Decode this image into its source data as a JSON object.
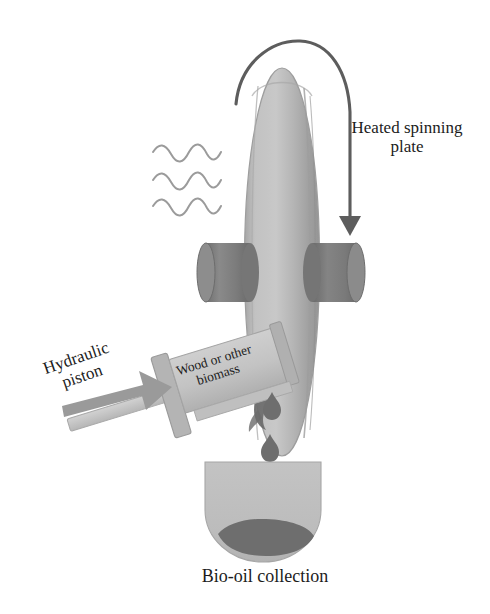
{
  "figure": {
    "background_color": "#ffffff",
    "width": 490,
    "height": 614
  },
  "labels": {
    "heated_plate": "Heated spinning\nplate",
    "hydraulic_piston": "Hydraulic\npiston",
    "biomass": "Wood or other\nbiomass",
    "bio_oil_collection": "Bio-oil collection"
  },
  "colors": {
    "plate_light_grey": "#b9b9b9",
    "plate_edge_grey": "#a2a2a2",
    "roller_dark_grey": "#7d7d7d",
    "syringe_body_grey": "#c2c2c2",
    "syringe_flange_grey": "#aeaeae",
    "piston_rod_grey": "#c8c8c8",
    "force_arrow_grey": "#9a9a9a",
    "oil_dark_grey": "#6e6e6e",
    "char_streak_grey": "#6b6b6b",
    "beaker_fill_grey": "#bdbdbd",
    "heat_wave_grey": "#9b9b9b",
    "rotation_arrow_grey": "#5d5d5d",
    "text_color": "#1c1c1c"
  },
  "components": [
    {
      "name": "heated-spinning-plate",
      "shape": "vertical elongated ellipse (disc seen edge-on)",
      "fill": "#b9b9b9",
      "bbox": [
        245,
        68,
        75,
        388
      ]
    },
    {
      "name": "rotation-arrow",
      "shape": "arc over plate top ending in downward arrowhead",
      "stroke": "#5d5d5d",
      "direction": "clockwise, from left over top down the right side"
    },
    {
      "name": "heat-waves",
      "shape": "three horizontal wavy lines",
      "count": 3,
      "stroke": "#9b9b9b",
      "bbox": [
        152,
        140,
        88,
        62
      ]
    },
    {
      "name": "upper-roller-left",
      "shape": "cylinder",
      "fill": "#7d7d7d",
      "bbox": [
        204,
        242,
        46,
        60
      ]
    },
    {
      "name": "upper-roller-right",
      "shape": "cylinder",
      "fill": "#7d7d7d",
      "bbox": [
        312,
        242,
        46,
        60
      ]
    },
    {
      "name": "biomass-syringe-barrel",
      "shape": "tilted rectangular barrel holding biomass",
      "fill": "#c2c2c2",
      "rotation_deg": -17
    },
    {
      "name": "syringe-flange",
      "shape": "plunger flange disc",
      "fill": "#aeaeae"
    },
    {
      "name": "piston-rod",
      "shape": "rod entering barrel from lower left",
      "fill": "#c8c8c8"
    },
    {
      "name": "force-arrow",
      "shape": "thick right-pointing arrow",
      "fill": "#9a9a9a"
    },
    {
      "name": "char-streak",
      "shape": "dark residue where biomass meets plate",
      "fill": "#6b6b6b"
    },
    {
      "name": "oil-droplets",
      "shape": "teardrops falling from plate into beaker",
      "count": 4,
      "fill": "#6e6e6e"
    },
    {
      "name": "collection-beaker",
      "shape": "flat-topped round-bottom vessel",
      "fill": "#bdbdbd",
      "bbox": [
        205,
        462,
        116,
        96
      ]
    },
    {
      "name": "bio-oil-pool",
      "shape": "dark pooled liquid in beaker bottom",
      "fill": "#6e6e6e"
    }
  ]
}
